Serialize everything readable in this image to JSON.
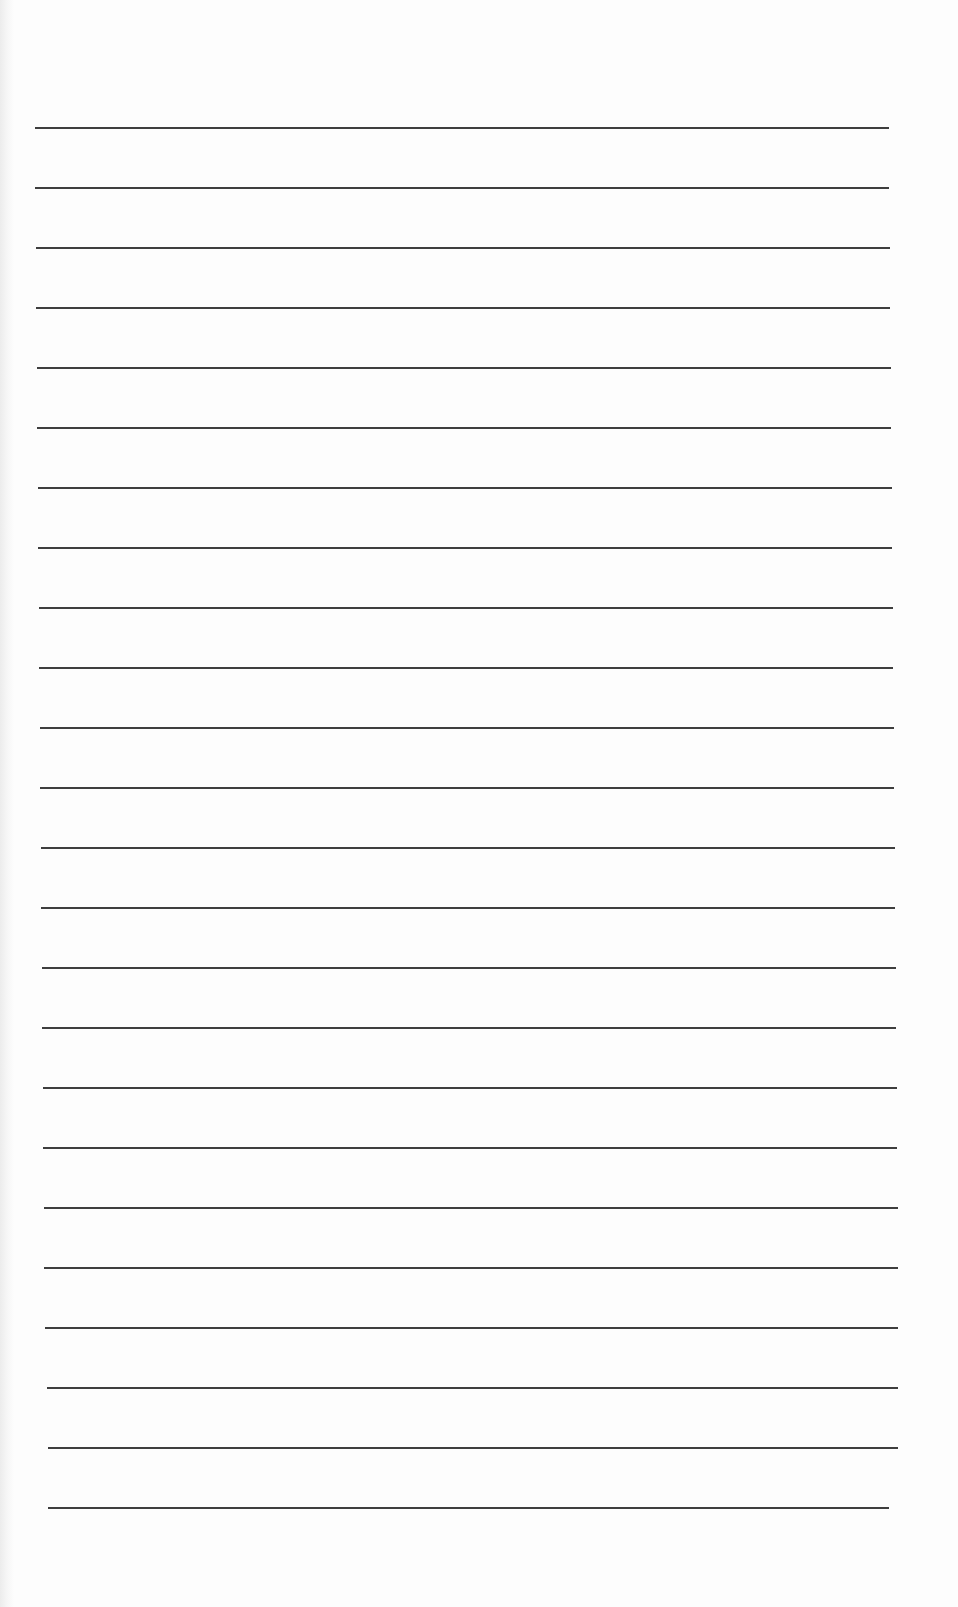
{
  "document": {
    "type": "lined-paper",
    "background_color": "#fdfdfd",
    "line_color": "#2e2e2e",
    "line_count": 24,
    "lines": [
      {
        "y": 127,
        "x1": 35,
        "x2": 889
      },
      {
        "y": 187,
        "x1": 35,
        "x2": 889
      },
      {
        "y": 247,
        "x1": 36,
        "x2": 890
      },
      {
        "y": 307,
        "x1": 36,
        "x2": 890
      },
      {
        "y": 367,
        "x1": 37,
        "x2": 891
      },
      {
        "y": 427,
        "x1": 37,
        "x2": 891
      },
      {
        "y": 487,
        "x1": 38,
        "x2": 892
      },
      {
        "y": 547,
        "x1": 38,
        "x2": 892
      },
      {
        "y": 607,
        "x1": 39,
        "x2": 893
      },
      {
        "y": 667,
        "x1": 39,
        "x2": 893
      },
      {
        "y": 727,
        "x1": 40,
        "x2": 894
      },
      {
        "y": 787,
        "x1": 40,
        "x2": 894
      },
      {
        "y": 847,
        "x1": 41,
        "x2": 895
      },
      {
        "y": 907,
        "x1": 41,
        "x2": 895
      },
      {
        "y": 967,
        "x1": 42,
        "x2": 896
      },
      {
        "y": 1027,
        "x1": 42,
        "x2": 896
      },
      {
        "y": 1087,
        "x1": 43,
        "x2": 897
      },
      {
        "y": 1147,
        "x1": 43,
        "x2": 897
      },
      {
        "y": 1207,
        "x1": 44,
        "x2": 898
      },
      {
        "y": 1267,
        "x1": 44,
        "x2": 898
      },
      {
        "y": 1327,
        "x1": 45,
        "x2": 898
      },
      {
        "y": 1387,
        "x1": 47,
        "x2": 898
      },
      {
        "y": 1447,
        "x1": 48,
        "x2": 898
      },
      {
        "y": 1507,
        "x1": 48,
        "x2": 889
      }
    ]
  }
}
